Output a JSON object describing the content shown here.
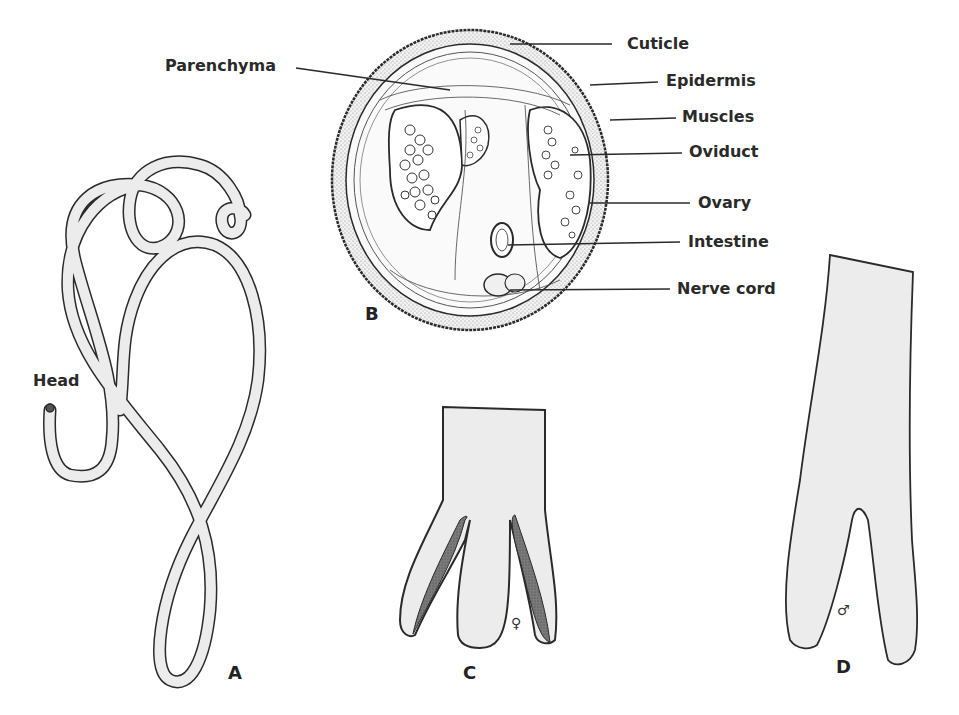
{
  "figure": {
    "panels": {
      "A": {
        "letter": "A",
        "caption_label": "Head"
      },
      "B": {
        "letter": "B",
        "labels": {
          "parenchyma": "Parenchyma",
          "cuticle": "Cuticle",
          "epidermis": "Epidermis",
          "muscles": "Muscles",
          "oviduct": "Oviduct",
          "ovary": "Ovary",
          "intestine": "Intestine",
          "nerve_cord": "Nerve cord"
        }
      },
      "C": {
        "letter": "C",
        "sex_symbol": "♀"
      },
      "D": {
        "letter": "D",
        "sex_symbol": "♂"
      }
    },
    "colors": {
      "ink": "#2a2a2a",
      "body_fill": "#ececec",
      "stipple": "#d6d6d6",
      "dark_spicule": "#6a6a6a"
    }
  }
}
